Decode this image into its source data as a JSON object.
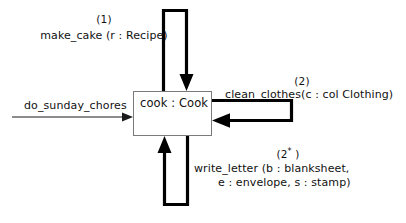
{
  "diagram": {
    "type": "uml-communication-diagram",
    "background_color": "#ffffff",
    "line_color": "#000000",
    "object_border_color": "#7a7a7a",
    "text_color": "#111111",
    "object": {
      "label": "cook : Cook",
      "name": "cook",
      "class": "Cook"
    },
    "entry_message": {
      "label": "do_sunday_chores",
      "direction": "incoming",
      "style": "thin"
    },
    "messages": [
      {
        "id": "top",
        "sequence": "(1)",
        "label": "make_cake (r : Recipe)",
        "position": "top",
        "style": "thick-self-loop"
      },
      {
        "id": "right",
        "sequence": "(2)",
        "label": "clean_clothes(c : col Clothing)",
        "position": "right",
        "style": "thick-self-loop"
      },
      {
        "id": "bottom",
        "sequence_prefix": "(2",
        "sequence_star": "*",
        "sequence_suffix": " )",
        "label_line1": "write_letter (b : blanksheet,",
        "label_line2": "e : envelope, s : stamp)",
        "position": "bottom",
        "style": "thick-self-loop"
      }
    ]
  }
}
